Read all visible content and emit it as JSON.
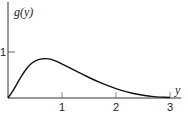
{
  "chart_data": {
    "type": "line",
    "title": "",
    "xlabel": "y",
    "ylabel": "g(y)",
    "xlim": [
      0,
      3.2
    ],
    "ylim": [
      0,
      1.5
    ],
    "x_ticks": [
      "1",
      "2",
      "3"
    ],
    "y_ticks": [
      "1"
    ],
    "grid": false,
    "legend": null,
    "series": [
      {
        "name": "g(y)",
        "x": [
          0,
          0.1,
          0.2,
          0.3,
          0.4,
          0.5,
          0.6,
          0.7,
          0.8,
          0.9,
          1.0,
          1.2,
          1.4,
          1.6,
          1.8,
          2.0,
          2.2,
          2.4,
          2.6,
          2.8,
          3.0
        ],
        "y": [
          0,
          0.17,
          0.38,
          0.57,
          0.72,
          0.81,
          0.85,
          0.86,
          0.84,
          0.8,
          0.74,
          0.62,
          0.5,
          0.39,
          0.29,
          0.2,
          0.13,
          0.08,
          0.04,
          0.02,
          0.01
        ]
      }
    ]
  },
  "labels": {
    "ylabel": "g(y)",
    "xlabel": "y",
    "ytick_1": "1",
    "xtick_1": "1",
    "xtick_2": "2",
    "xtick_3": "3"
  }
}
